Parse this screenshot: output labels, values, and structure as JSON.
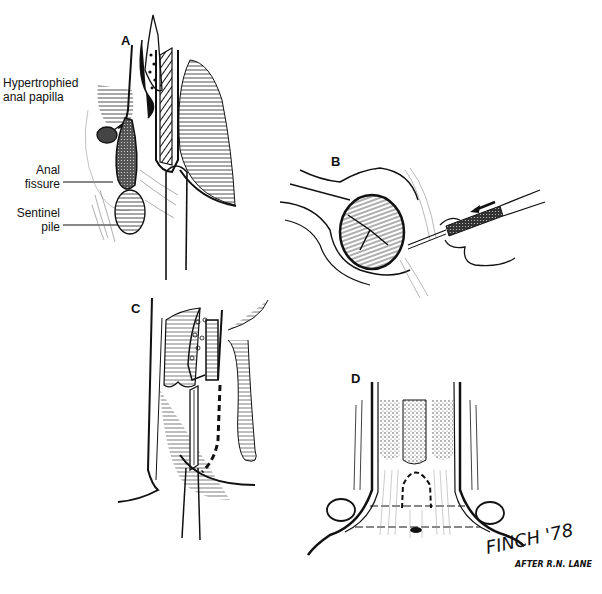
{
  "figure": {
    "style": "black-and-white pen illustration",
    "panels": [
      {
        "id": "A",
        "label": "A",
        "annotations": [
          {
            "line1": "Hypertrophied",
            "line2": "anal papilla"
          },
          {
            "line1": "Anal",
            "line2": "fissure"
          },
          {
            "line1": "Sentinel",
            "line2": "pile"
          }
        ]
      },
      {
        "id": "B",
        "label": "B"
      },
      {
        "id": "C",
        "label": "C"
      },
      {
        "id": "D",
        "label": "D"
      }
    ],
    "signature": {
      "artist": "FINCH '78",
      "credit": "AFTER R.N. LANE"
    }
  }
}
